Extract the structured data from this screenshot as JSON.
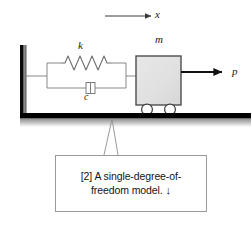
{
  "figure": {
    "type": "engineering-diagram",
    "background_color": "#ffffff"
  },
  "labels": {
    "displacement": "x",
    "stiffness": "k",
    "damping": "c",
    "mass": "m",
    "force": "p"
  },
  "caption": {
    "line1": "[2] A single-degree-of-",
    "line2": "freedom model.",
    "arrow_glyph": "↓",
    "full_text": "[2] A single-degree-of-freedom model. ↓"
  },
  "colors": {
    "ink": "#1a1a1a",
    "line": "#6e6e6e",
    "mass_fill": "#e2e2e2",
    "mass_stroke": "#4d4d4d",
    "ground": "#000000",
    "wall": "#000000",
    "caption_border": "#9a9a9a"
  },
  "components": {
    "arrow_x": {
      "name": "displacement-direction-arrow",
      "x1": 105,
      "y1": 16,
      "x2": 153,
      "y2": 16
    },
    "wall": {
      "name": "fixed-wall-support",
      "x": 20,
      "y": 45,
      "width": 6,
      "height": 70
    },
    "spring": {
      "name": "spring-element",
      "coils": 6,
      "x1": 62,
      "x2": 110,
      "y": 63
    },
    "damper": {
      "name": "damper-element",
      "x": 86,
      "y": 88
    },
    "mass_block": {
      "name": "mass-block",
      "x": 136,
      "y": 56,
      "width": 45,
      "height": 49
    },
    "wheels": {
      "name": "wheel",
      "count": 2,
      "radius": 5,
      "cx": [
        147,
        170
      ],
      "cy": 109
    },
    "force_arrow": {
      "name": "applied-force-arrow",
      "x1": 181,
      "y1": 72,
      "x2": 226,
      "y2": 72
    },
    "ground": {
      "name": "ground-line",
      "x": 20,
      "y": 113,
      "width": 230,
      "height": 5
    },
    "leader": {
      "name": "caption-leader-line",
      "apex_x": 112,
      "apex_y": 118,
      "left_x": 104,
      "right_x": 118,
      "bottom_y": 155
    }
  }
}
